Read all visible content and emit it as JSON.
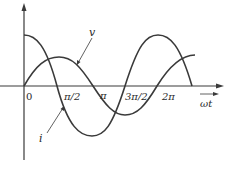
{
  "diagram": {
    "title": "",
    "axes": {
      "x_label": "ωt",
      "ticks": [
        {
          "label": "0",
          "x": 27,
          "y": 100
        },
        {
          "label": "π/2",
          "x": 64,
          "y": 100
        },
        {
          "label": "π",
          "x": 100,
          "y": 99
        },
        {
          "label": "3π/2",
          "x": 126,
          "y": 100
        },
        {
          "label": "2π",
          "x": 163,
          "y": 100
        }
      ]
    },
    "curves": [
      {
        "name": "v",
        "label": "v",
        "type": "sine",
        "amplitude": "small",
        "phase": "0"
      },
      {
        "name": "i",
        "label": "i",
        "type": "cosine",
        "amplitude": "large",
        "phase": "leads by π/2"
      }
    ],
    "colors": {
      "line": "#3a3a3a",
      "background": "#ffffff"
    }
  }
}
